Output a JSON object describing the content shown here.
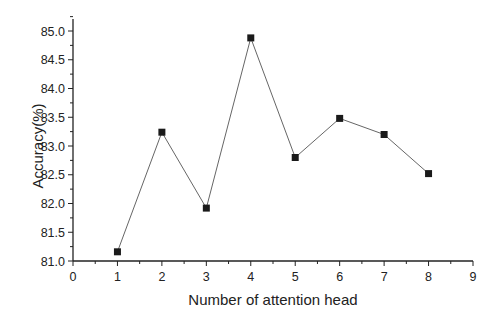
{
  "chart_data": {
    "type": "line",
    "title": "",
    "xlabel": "Number of attention head",
    "ylabel": "Accuracy(%)",
    "xlim": [
      0,
      9
    ],
    "ylim": [
      81.0,
      85.2
    ],
    "x_ticks": [
      "0",
      "1",
      "2",
      "3",
      "4",
      "5",
      "6",
      "7",
      "8",
      "9"
    ],
    "y_ticks": [
      "81.0",
      "81.5",
      "82.0",
      "82.5",
      "83.0",
      "83.5",
      "84.0",
      "84.5",
      "85.0"
    ],
    "grid": false,
    "legend": null,
    "marker": "square",
    "series": [
      {
        "name": "Accuracy",
        "x": [
          1,
          2,
          3,
          4,
          5,
          6,
          7,
          8
        ],
        "values": [
          81.16,
          83.24,
          81.92,
          84.88,
          82.8,
          83.48,
          83.2,
          82.52
        ]
      }
    ]
  },
  "colors": {
    "line": "#666666",
    "marker": "#1a1a1a",
    "axis": "#222222"
  }
}
